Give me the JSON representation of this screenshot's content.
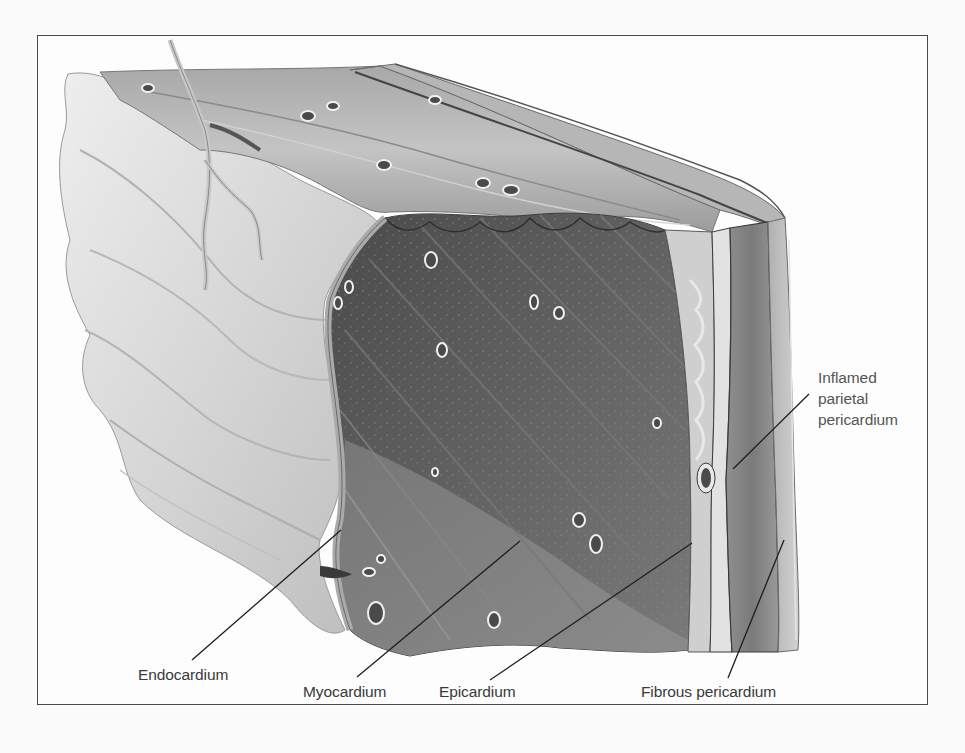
{
  "figure": {
    "colors": {
      "background": "#fbfbfb",
      "frame_border": "#4a4a4a",
      "label_text": "#3a3a3a",
      "leader_line": "#1e1e1e",
      "endocardium": "#d8d8d8",
      "myocardium_cut": "#5a5a5a",
      "myocardium_surface": "#9a9a9a",
      "epicardium": "#b8b8b8",
      "parietal_pericardium": "#8a8a8a",
      "fibrous_pericardium": "#c2c2c2"
    }
  },
  "labels": {
    "endocardium": "Endocardium",
    "myocardium": "Myocardium",
    "epicardium": "Epicardium",
    "fibrous_pericardium": "Fibrous pericardium",
    "inflamed_parietal_pericardium": "Inflamed\nparietal\npericardium"
  },
  "leaders": [
    {
      "label": "Endocardium",
      "from": [
        192,
        660
      ],
      "to": [
        341,
        530
      ]
    },
    {
      "label": "Myocardium",
      "from": [
        357,
        677
      ],
      "to": [
        520,
        541
      ]
    },
    {
      "label": "Epicardium",
      "from": [
        490,
        680
      ],
      "to": [
        692,
        543
      ]
    },
    {
      "label": "Fibrous pericardium",
      "from": [
        728,
        678
      ],
      "to": [
        784,
        540
      ]
    },
    {
      "label": "Inflamed parietal pericardium",
      "from": [
        809,
        394
      ],
      "to": [
        733,
        469
      ]
    }
  ]
}
